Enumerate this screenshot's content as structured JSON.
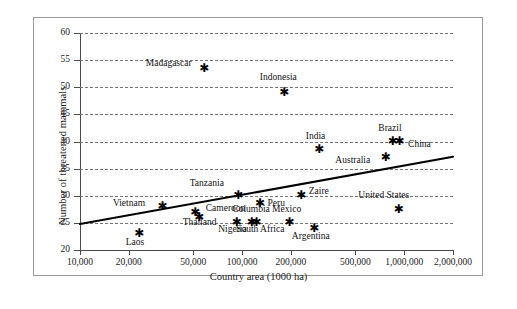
{
  "chart_data": {
    "type": "scatter",
    "title": "",
    "xlabel": "Country area (1000 ha)",
    "ylabel": "Number of threatened mammals",
    "xscale": "log",
    "xlim": [
      10000,
      2000000
    ],
    "ylim": [
      20,
      60
    ],
    "xticks": [
      10000,
      20000,
      50000,
      100000,
      200000,
      500000,
      1000000,
      2000000
    ],
    "xtick_labels": [
      "10,000",
      "20,000",
      "50,000",
      "100,000",
      "200,000",
      "500,000",
      "1,000,000",
      "2,000,000"
    ],
    "yticks": [
      20,
      25,
      30,
      35,
      40,
      45,
      50,
      55,
      60
    ],
    "ytick_labels": [
      "20",
      "25",
      "30",
      "35",
      "40",
      "45",
      "50",
      "55",
      "60"
    ],
    "grid": "horizontal-dashed",
    "legend": "none",
    "points": [
      {
        "label": "Madagascar",
        "x": 58000,
        "y": 53.5,
        "lx": -58,
        "ly": -5
      },
      {
        "label": "Indonesia",
        "x": 181000,
        "y": 49.0,
        "lx": -24,
        "ly": -16
      },
      {
        "label": "India",
        "x": 297000,
        "y": 38.5,
        "lx": -13,
        "ly": -14
      },
      {
        "label": "Brazil",
        "x": 845000,
        "y": 40.0,
        "lx": -14,
        "ly": -14
      },
      {
        "label": "China",
        "x": 930000,
        "y": 40.0,
        "lx": 9,
        "ly": 2
      },
      {
        "label": "Australia",
        "x": 765000,
        "y": 37.0,
        "lx": -50,
        "ly": 2
      },
      {
        "label": "Zaire",
        "x": 230000,
        "y": 30.0,
        "lx": 8,
        "ly": -5
      },
      {
        "label": "Tanzania",
        "x": 94000,
        "y": 30.0,
        "lx": -48,
        "ly": -13
      },
      {
        "label": "Peru",
        "x": 128000,
        "y": 28.5,
        "lx": 8,
        "ly": -1
      },
      {
        "label": "Vietnam",
        "x": 32000,
        "y": 28.0,
        "lx": -49,
        "ly": -4
      },
      {
        "label": "Thailand",
        "x": 51000,
        "y": 27.0,
        "lx": -12,
        "ly": 10
      },
      {
        "label": "Cameroon",
        "x": 54000,
        "y": 26.0,
        "lx": 7,
        "ly": -9
      },
      {
        "label": "United States",
        "x": 920000,
        "y": 27.5,
        "lx": -40,
        "ly": -14
      },
      {
        "label": "Nigeria",
        "x": 92000,
        "y": 25.0,
        "lx": -18,
        "ly": 6
      },
      {
        "label": "Columbia",
        "x": 114000,
        "y": 25.0,
        "lx": -19,
        "ly": -14
      },
      {
        "label": "South Africa",
        "x": 122000,
        "y": 25.0,
        "lx": -20,
        "ly": 6
      },
      {
        "label": "Mexico",
        "x": 195000,
        "y": 25.0,
        "lx": -17,
        "ly": -14
      },
      {
        "label": "Argentina",
        "x": 277000,
        "y": 24.0,
        "lx": -22,
        "ly": 8
      },
      {
        "label": "Laos",
        "x": 23000,
        "y": 23.0,
        "lx": -13,
        "ly": 8
      }
    ],
    "fit_line": {
      "type": "linear-on-log-x",
      "x_start": 10000,
      "y_start": 24.8,
      "x_end": 2000000,
      "y_end": 37.2
    }
  }
}
